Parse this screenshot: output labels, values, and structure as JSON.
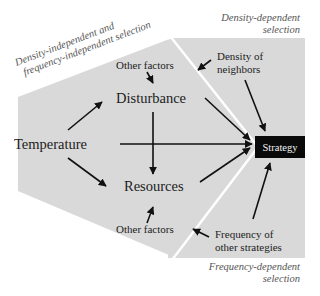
{
  "diagram": {
    "regions": {
      "left": {
        "label_line1": "Density-independent and",
        "label_line2": "frequency-independent selection"
      },
      "top_right": {
        "label_line1": "Density-dependent",
        "label_line2": "selection"
      },
      "bottom_right": {
        "label_line1": "Frequency-dependent",
        "label_line2": "selection"
      }
    },
    "nodes": {
      "temperature": "Temperature",
      "disturbance": "Disturbance",
      "resources": "Resources",
      "other_factors_top": "Other factors",
      "other_factors_bottom": "Other factors",
      "density_line1": "Density of",
      "density_line2": "neighbors",
      "frequency_line1": "Frequency of",
      "frequency_line2": "other strategies",
      "strategy": "Strategy"
    },
    "edges": [
      [
        "Temperature",
        "Disturbance"
      ],
      [
        "Temperature",
        "Resources"
      ],
      [
        "Temperature",
        "Strategy"
      ],
      [
        "Disturbance",
        "Resources"
      ],
      [
        "Disturbance",
        "Strategy"
      ],
      [
        "Resources",
        "Strategy"
      ],
      [
        "Other factors (top)",
        "Disturbance"
      ],
      [
        "Other factors (bottom)",
        "Resources"
      ],
      [
        "Density of neighbors",
        "Strategy"
      ],
      [
        "Density of neighbors",
        "Density-independent region"
      ],
      [
        "Frequency of other strategies",
        "Strategy"
      ],
      [
        "Frequency of other strategies",
        "Density-independent region"
      ]
    ],
    "colors": {
      "region_fill": "#d9d9d9",
      "divider": "#ffffff",
      "arrow": "#111111",
      "strategy_box": "#0a0a0a",
      "strategy_text": "#f2f2f2"
    }
  }
}
